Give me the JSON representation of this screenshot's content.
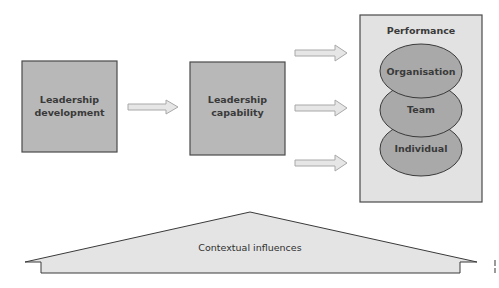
{
  "diagram": {
    "nodes": {
      "leadership_development": {
        "line1": "Leadership",
        "line2": "development"
      },
      "leadership_capability": {
        "line1": "Leadership",
        "line2": "capability"
      },
      "performance": {
        "title": "Performance",
        "levels": [
          "Organisation",
          "Team",
          "Individual"
        ]
      }
    },
    "base": {
      "label": "Contextual influences"
    },
    "colors": {
      "box_fill": "#b8b8b8",
      "panel_fill": "#e2e2e2",
      "ellipse_fill": "#a9a9a9",
      "arrow_fill": "#e6e6e6",
      "base_fill": "#e4e4e4",
      "stroke": "#444444"
    },
    "edges": [
      {
        "from": "Leadership development",
        "to": "Leadership capability"
      },
      {
        "from": "Leadership capability",
        "to": "Organisation"
      },
      {
        "from": "Leadership capability",
        "to": "Team"
      },
      {
        "from": "Leadership capability",
        "to": "Individual"
      }
    ]
  }
}
